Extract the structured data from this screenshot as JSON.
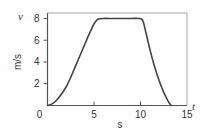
{
  "chart_data": {
    "type": "line",
    "title": "",
    "xlabel": "s",
    "ylabel": "m/s",
    "x_variable": "t",
    "y_variable": "v",
    "xlim": [
      0,
      15
    ],
    "ylim": [
      0,
      8.5
    ],
    "xticks": [
      0,
      5,
      10,
      15
    ],
    "yticks": [
      0,
      2,
      4,
      6,
      8
    ],
    "xtick_labels": [
      "0",
      "5",
      "10",
      "15"
    ],
    "ytick_labels": [
      "",
      "2",
      "4",
      "6",
      "8"
    ],
    "grid": false,
    "legend": "none",
    "colors": {
      "line": "#444444",
      "axis": "#555555",
      "frame": "#aaaaaa"
    },
    "series": [
      {
        "name": "velocity",
        "x": [
          0,
          0.5,
          1,
          1.5,
          2,
          2.5,
          3,
          3.5,
          4,
          4.5,
          5,
          5.3,
          5.6,
          6,
          7,
          8,
          9,
          9.8,
          10.1,
          10.3,
          10.5,
          11,
          11.5,
          12,
          12.5,
          13,
          13.3
        ],
        "y": [
          0,
          0.15,
          0.5,
          1.05,
          1.7,
          2.6,
          3.6,
          4.6,
          5.6,
          6.6,
          7.5,
          7.85,
          7.97,
          8,
          8,
          8,
          8,
          8,
          7.95,
          7.7,
          7.0,
          5.2,
          3.6,
          2.3,
          1.2,
          0.35,
          0
        ]
      }
    ]
  }
}
